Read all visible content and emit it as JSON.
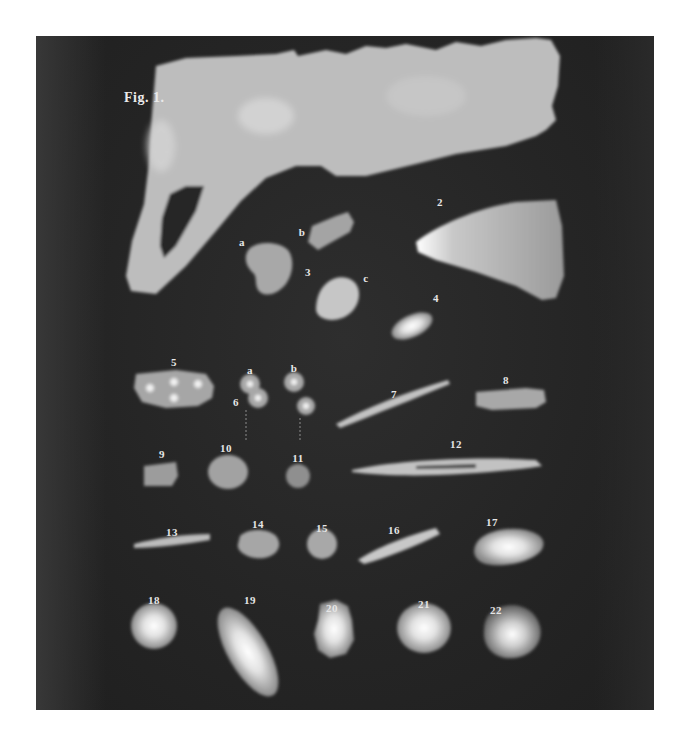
{
  "figure": {
    "title": "Fig. 1.",
    "background_color": "#262626",
    "specimen_color": "#b9b9b9"
  },
  "labels": {
    "s2": "2",
    "s3a": "a",
    "s3b": "b",
    "s3": "3",
    "s3c": "c",
    "s4": "4",
    "s5": "5",
    "s6a": "a",
    "s6b": "b",
    "s6": "6",
    "s7": "7",
    "s8": "8",
    "s9": "9",
    "s10": "10",
    "s11": "11",
    "s12": "12",
    "s13": "13",
    "s14": "14",
    "s15": "15",
    "s16": "16",
    "s17": "17",
    "s18": "18",
    "s19": "19",
    "s20": "20",
    "s21": "21",
    "s22": "22"
  }
}
